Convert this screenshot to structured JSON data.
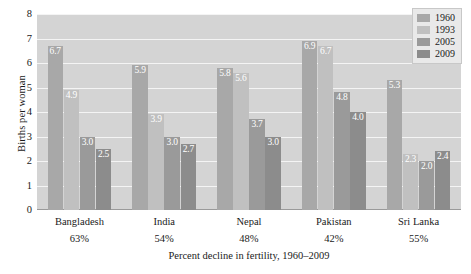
{
  "chart_data": {
    "type": "bar",
    "title": "",
    "xlabel": "Percent decline in fertility, 1960–2009",
    "ylabel": "Births per woman",
    "ylim": [
      0,
      8
    ],
    "yticks": [
      0,
      1,
      2,
      3,
      4,
      5,
      6,
      7,
      8
    ],
    "grid": true,
    "legend_position": "top-right",
    "categories": [
      "Bangladesh",
      "India",
      "Nepal",
      "Pakistan",
      "Sri Lanka"
    ],
    "category_sublabels": [
      "63%",
      "54%",
      "48%",
      "42%",
      "55%"
    ],
    "series": [
      {
        "name": "1960",
        "color": "#a8a8a8",
        "values": [
          6.7,
          5.9,
          5.8,
          6.9,
          5.3
        ]
      },
      {
        "name": "1993",
        "color": "#c0c0c0",
        "values": [
          4.9,
          3.9,
          5.6,
          6.7,
          2.3
        ]
      },
      {
        "name": "2005",
        "color": "#9a9a9a",
        "values": [
          3.0,
          3.0,
          3.7,
          4.8,
          2.0
        ]
      },
      {
        "name": "2009",
        "color": "#8c8c8c",
        "values": [
          2.5,
          2.7,
          3.0,
          4.0,
          2.4
        ]
      }
    ],
    "value_labels": [
      [
        "6.7",
        "4.9",
        "3.0",
        "2.5"
      ],
      [
        "5.9",
        "3.9",
        "3.0",
        "2.7"
      ],
      [
        "5.8",
        "5.6",
        "3.7",
        "3.0"
      ],
      [
        "6.9",
        "6.7",
        "4.8",
        "4.0"
      ],
      [
        "5.3",
        "2.3",
        "2.0",
        "2.4"
      ]
    ],
    "plot_background": "#d4d4d4",
    "gridline_color": "#f4f4f4"
  }
}
